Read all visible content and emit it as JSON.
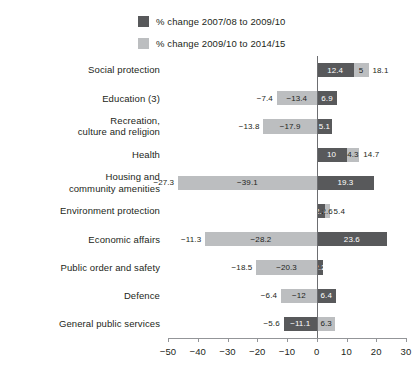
{
  "legend": {
    "items": [
      {
        "label": "% change 2007/08 to 2009/10",
        "color": "#58595b",
        "key": "dark"
      },
      {
        "label": "% change 2009/10 to 2014/15",
        "color": "#bcbec0",
        "key": "light"
      }
    ]
  },
  "axis": {
    "ticks": [
      "-50",
      "-40",
      "-30",
      "-20",
      "-10",
      "0",
      "10",
      "20",
      "30"
    ],
    "min": -50,
    "max": 30,
    "step": 10
  },
  "chart_data": {
    "type": "bar",
    "title": "",
    "xlabel": "",
    "ylabel": "",
    "xlim": [
      -50,
      30
    ],
    "grid": false,
    "legend_position": "top",
    "orientation": "horizontal",
    "categories": [
      "Social protection",
      "Education (3)",
      "Recreation, culture and religion",
      "Health",
      "Housing and community amenities",
      "Environment protection",
      "Economic affairs",
      "Public order and safety",
      "Defence",
      "General public services"
    ],
    "series": [
      {
        "name": "% change 2007/08 to 2009/10",
        "color": "#58595b",
        "values": [
          12.4,
          6.9,
          5.1,
          10,
          19.3,
          2.7,
          23.6,
          2.2,
          6.4,
          -11.1
        ]
      },
      {
        "name": "% change 2009/10 to 2014/15",
        "color": "#bcbec0",
        "values": [
          5,
          -13.4,
          -17.9,
          4.3,
          -39.1,
          2.6,
          -28.2,
          -20.3,
          -12,
          6.3
        ]
      }
    ],
    "totals": [
      18.1,
      -7.4,
      -13.8,
      14.7,
      -27.3,
      5.4,
      -11.3,
      -18.5,
      -6.4,
      -5.6
    ]
  },
  "rows": [
    {
      "category": "Social protection",
      "lines": [
        "Social protection"
      ],
      "dark": {
        "value": 12.4,
        "label": "12.4",
        "start": 0,
        "end": 12.4
      },
      "light": {
        "value": 5,
        "label": "5",
        "start": 12.4,
        "end": 17.4
      },
      "total": {
        "label": "18.1",
        "side": "right"
      }
    },
    {
      "category": "Education (3)",
      "lines": [
        "Education (3)"
      ],
      "dark": {
        "value": 6.9,
        "label": "6.9",
        "start": 0,
        "end": 6.9
      },
      "light": {
        "value": -13.4,
        "label": "-13.4",
        "start": -13.4,
        "end": 0
      },
      "total": {
        "label": "-7.4",
        "side": "left"
      }
    },
    {
      "category": "Recreation, culture and religion",
      "lines": [
        "Recreation,",
        "culture and religion"
      ],
      "dark": {
        "value": 5.1,
        "label": "5.1",
        "start": 0,
        "end": 5.1
      },
      "light": {
        "value": -17.9,
        "label": "-17.9",
        "start": -17.9,
        "end": 0
      },
      "total": {
        "label": "-13.8",
        "side": "left"
      }
    },
    {
      "category": "Health",
      "lines": [
        "Health"
      ],
      "dark": {
        "value": 10,
        "label": "10",
        "start": 0,
        "end": 10
      },
      "light": {
        "value": 4.3,
        "label": "4.3",
        "start": 10,
        "end": 14.3
      },
      "total": {
        "label": "14.7",
        "side": "right"
      }
    },
    {
      "category": "Housing and community amenities",
      "lines": [
        "Housing and",
        "community amenities"
      ],
      "dark": {
        "value": 19.3,
        "label": "19.3",
        "start": 0,
        "end": 19.3
      },
      "light": {
        "value": -39.1,
        "label": "-39.1",
        "start": -46.6,
        "end": 0
      },
      "total": {
        "label": "-27.3",
        "side": "left"
      }
    },
    {
      "category": "Environment protection",
      "lines": [
        "Environment protection"
      ],
      "dark": {
        "value": 2.7,
        "label": "2.7",
        "start": 0,
        "end": 2.7
      },
      "light": {
        "value": 2.6,
        "label": "2.6",
        "start": 2.7,
        "end": 4.3
      },
      "total": {
        "label": "5.4",
        "side": "right"
      }
    },
    {
      "category": "Economic affairs",
      "lines": [
        "Economic affairs"
      ],
      "dark": {
        "value": 23.6,
        "label": "23.6",
        "start": 0,
        "end": 23.6
      },
      "light": {
        "value": -28.2,
        "label": "-28.2",
        "start": -37.5,
        "end": 0
      },
      "total": {
        "label": "-11.3",
        "side": "left"
      }
    },
    {
      "category": "Public order and safety",
      "lines": [
        "Public order and safety"
      ],
      "dark": {
        "value": 2.2,
        "label": "2.2",
        "start": 0,
        "end": 2.2
      },
      "light": {
        "value": -20.3,
        "label": "-20.3",
        "start": -20.3,
        "end": 0
      },
      "total": {
        "label": "-18.5",
        "side": "left"
      }
    },
    {
      "category": "Defence",
      "lines": [
        "Defence"
      ],
      "dark": {
        "value": 6.4,
        "label": "6.4",
        "start": 0,
        "end": 6.4
      },
      "light": {
        "value": -12,
        "label": "-12",
        "start": -12,
        "end": 0
      },
      "total": {
        "label": "-6.4",
        "side": "left"
      }
    },
    {
      "category": "General public services",
      "lines": [
        "General public services"
      ],
      "dark": {
        "value": -11.1,
        "label": "-11.1",
        "start": -11.1,
        "end": 0
      },
      "light": {
        "value": 6.3,
        "label": "6.3",
        "start": 0,
        "end": 6.3
      },
      "total": {
        "label": "-5.6",
        "side": "left"
      }
    }
  ]
}
